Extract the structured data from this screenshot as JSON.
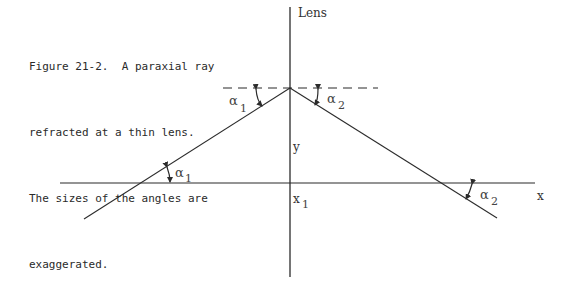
{
  "figure": {
    "caption_lines": [
      "Figure 21-2.  A paraxial ray",
      "refracted at a thin lens.",
      "The sizes of the angles are",
      "exaggerated."
    ],
    "labels": {
      "lens": "Lens",
      "y": "y",
      "x_axis": "x",
      "x1_base": "x",
      "x1_sub": "1",
      "alpha1_top_base": "α",
      "alpha1_top_sub": "1",
      "alpha2_top_base": "α",
      "alpha2_top_sub": "2",
      "alpha1_bottom_base": "α",
      "alpha1_bottom_sub": "1",
      "alpha2_bottom_base": "α",
      "alpha2_bottom_sub": "2"
    },
    "colors": {
      "line": "#2b2b2b",
      "text": "#2a2a2a",
      "background": "#ffffff"
    }
  }
}
